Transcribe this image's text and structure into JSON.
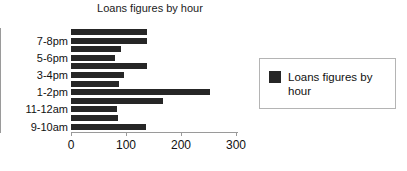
{
  "chart_data": {
    "type": "bar",
    "orientation": "horizontal",
    "title": "Loans figures by hour",
    "xlabel": "",
    "ylabel": "",
    "xlim": [
      0,
      300
    ],
    "xticks": [
      0,
      100,
      200,
      300
    ],
    "xtick_labels": [
      "0",
      "100",
      "200",
      "300"
    ],
    "grid": false,
    "legend_position": "right",
    "series": [
      {
        "name": "Loans figures by hour",
        "color": "#262626",
        "values": [
          138,
          138,
          91,
          80,
          138,
          96,
          88,
          252,
          167,
          83,
          85,
          137
        ]
      }
    ],
    "categories": [
      "",
      "7-8pm",
      "",
      "5-6pm",
      "",
      "3-4pm",
      "",
      "1-2pm",
      "",
      "11-12am",
      "",
      "9-10am"
    ],
    "visible_category_labels": [
      "7-8pm",
      "5-6pm",
      "3-4pm",
      "1-2pm",
      "11-12am",
      "9-10am"
    ],
    "bars": [
      {
        "label": "",
        "value": 138
      },
      {
        "label": "7-8pm",
        "value": 138
      },
      {
        "label": "",
        "value": 91
      },
      {
        "label": "5-6pm",
        "value": 80
      },
      {
        "label": "",
        "value": 138
      },
      {
        "label": "3-4pm",
        "value": 96
      },
      {
        "label": "",
        "value": 88
      },
      {
        "label": "1-2pm",
        "value": 252
      },
      {
        "label": "",
        "value": 167
      },
      {
        "label": "11-12am",
        "value": 83
      },
      {
        "label": "",
        "value": 85
      },
      {
        "label": "9-10am",
        "value": 137
      }
    ]
  },
  "legend": {
    "entries": [
      {
        "label": "Loans figures by hour",
        "color": "#262626"
      }
    ]
  }
}
